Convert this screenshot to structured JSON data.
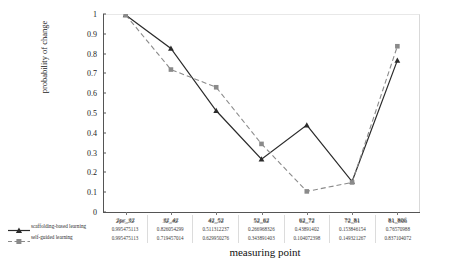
{
  "chart_data": {
    "type": "line",
    "title": "",
    "xlabel": "measuring point",
    "ylabel": "probability of change",
    "ylim": [
      0,
      1
    ],
    "yticks": [
      "0",
      "0.1",
      "0.2",
      "0.3",
      "0.4",
      "0.5",
      "0.6",
      "0.7",
      "0.8",
      "0.9",
      "1"
    ],
    "grid": false,
    "legend_position": "bottom-left",
    "categories": [
      "2pc_32",
      "32_42",
      "42_52",
      "52_62",
      "62_72",
      "72_81",
      "81_80б"
    ],
    "series": [
      {
        "name": "scaffolding-based learning",
        "marker": "triangle",
        "linestyle": "solid",
        "color": "#2b2b2b",
        "values": [
          0.995475113,
          0.826054299,
          0.511312237,
          0.266968326,
          0.43891402,
          0.153846154,
          0.76570988
        ],
        "labels": [
          "0.995475113",
          "0.826054299",
          "0.511312237",
          "0.266968326",
          "0.43891402",
          "0.153846154",
          "0.76570988"
        ]
      },
      {
        "name": "self-guided learning",
        "marker": "square",
        "linestyle": "dashed",
        "color": "#8a8a8a",
        "values": [
          0.995475113,
          0.719457014,
          0.629950276,
          0.343891403,
          0.104072398,
          0.149321267,
          0.837104072
        ],
        "labels": [
          "0.995475113",
          "0.719457014",
          "0.629950276",
          "0.343891403",
          "0.104072398",
          "0.149321267",
          "0.837104072"
        ]
      }
    ]
  }
}
